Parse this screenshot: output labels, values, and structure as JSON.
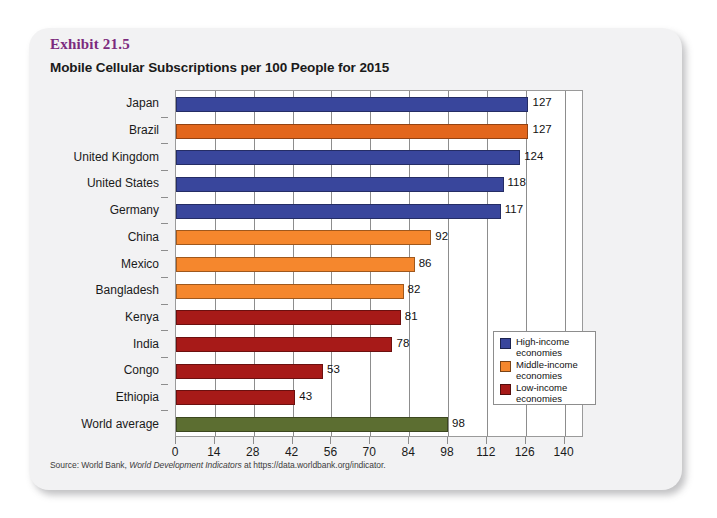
{
  "exhibit": {
    "label": "Exhibit 21.5",
    "title": "Mobile Cellular Subscriptions per 100 People for 2015"
  },
  "source": {
    "prefix": "Source: World Bank,",
    "italic": "World Development Indicators",
    "suffix": "at https://data.worldbank.org/indicator."
  },
  "legend": {
    "items": [
      {
        "label": "High-income\neconomies",
        "color": "#39469c"
      },
      {
        "label": "Middle-income\neconomies",
        "color": "#f5872d"
      },
      {
        "label": "Low-income\neconomies",
        "color": "#a71a18"
      }
    ]
  },
  "colors": {
    "high_income": "#39469c",
    "middle_income": "#f5872d",
    "middle_income_dark": "#e2661c",
    "low_income": "#a71a18",
    "world_average": "#5c6e31",
    "exhibit_label": "#7c2b7e",
    "panel_border": "#9a9a9a",
    "gridline": "#8d8d8d",
    "card_background": "#f2f2f3"
  },
  "chart_data": {
    "type": "bar",
    "orientation": "horizontal",
    "title": "Mobile Cellular Subscriptions per 100 People for 2015",
    "xlabel": "",
    "ylabel": "",
    "xlim": [
      0,
      147
    ],
    "xticks": [
      0,
      14,
      28,
      42,
      56,
      70,
      84,
      98,
      112,
      126,
      140
    ],
    "grid": "vertical",
    "legend_position": "inside-right-lower",
    "categories": [
      "Japan",
      "Brazil",
      "United Kingdom",
      "United States",
      "Germany",
      "China",
      "Mexico",
      "Bangladesh",
      "Kenya",
      "India",
      "Congo",
      "Ethiopia",
      "World average"
    ],
    "values": [
      127,
      127,
      124,
      118,
      117,
      92,
      86,
      82,
      81,
      78,
      53,
      43,
      98
    ],
    "groups": [
      "high_income",
      "middle_income",
      "high_income",
      "high_income",
      "high_income",
      "middle_income",
      "middle_income",
      "middle_income",
      "low_income",
      "low_income",
      "low_income",
      "low_income",
      "world_average"
    ],
    "bar_colors": [
      "#39469c",
      "#e2661c",
      "#39469c",
      "#39469c",
      "#39469c",
      "#f5872d",
      "#f5872d",
      "#f5872d",
      "#a71a18",
      "#a71a18",
      "#a71a18",
      "#a71a18",
      "#5c6e31"
    ],
    "data_labels": [
      "127",
      "127",
      "124",
      "118",
      "117",
      "92",
      "86",
      "82",
      "81",
      "78",
      "53",
      "43",
      "98"
    ],
    "series": [
      {
        "name": "Mobile cellular subscriptions per 100 people (2015)",
        "values": [
          127,
          127,
          124,
          118,
          117,
          92,
          86,
          82,
          81,
          78,
          53,
          43,
          98
        ]
      }
    ]
  }
}
